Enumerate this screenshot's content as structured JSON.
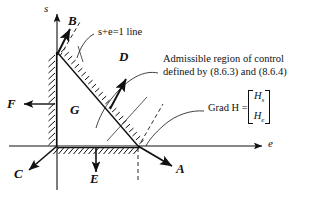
{
  "figure": {
    "background_color": "#ffffff",
    "ink_color": "#111111"
  },
  "axes": {
    "vertical_label": "s",
    "horizontal_label": "e",
    "origin": {
      "x": 57,
      "y": 146
    }
  },
  "annotations": {
    "line_label": "s+e=1 line",
    "region_text_line1": "Admissible region of control",
    "region_text_line2": "defined by (8.6.3) and (8.6.4)",
    "grad_label": "Grad H =",
    "grad_components": [
      "H",
      "H"
    ],
    "grad_subscripts": [
      "s",
      "e"
    ]
  },
  "vectors": [
    {
      "name": "A",
      "label": "A",
      "label_x": 179,
      "label_y": 168
    },
    {
      "name": "B",
      "label": "B",
      "label_x": 68,
      "label_y": 17
    },
    {
      "name": "C",
      "label": "C",
      "label_x": 16,
      "label_y": 173
    },
    {
      "name": "D",
      "label": "D",
      "label_x": 121,
      "label_y": 57
    },
    {
      "name": "E",
      "label": "E",
      "label_x": 93,
      "label_y": 178
    },
    {
      "name": "F",
      "label": "F",
      "label_x": 9,
      "label_y": 105
    },
    {
      "name": "G",
      "label": "G",
      "label_x": 73,
      "label_y": 110
    }
  ],
  "axis_labels": {
    "s_x": 44,
    "s_y": 6,
    "e_x": 269,
    "e_y": 140
  }
}
